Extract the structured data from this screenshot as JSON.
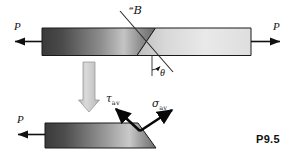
{
  "figure": {
    "tag": "P9.5",
    "labels": {
      "force_left_top": "P",
      "force_right_top": "P",
      "force_left_bottom": "P",
      "plane": "ᵊB",
      "plane_fallback": "P",
      "theta": "θ",
      "tau_symbol": "τ",
      "tau_sub": "av",
      "sigma_symbol": "σ",
      "sigma_sub": "av"
    },
    "colors": {
      "bar_dark": "#3f3f3f",
      "bar_mid": "#d6d6d6",
      "bar_light": "#f0f0f0",
      "outline": "#1a1a1a",
      "arrow_block": "#c9c9c9",
      "text": "#101010",
      "background": "#ffffff"
    },
    "elements": {
      "top_bar": "prismatic-bar-with-inclined-section-plane",
      "bottom_bar": "lower-segment-with-inclined-face",
      "transition_arrow": "downward-block-arrow",
      "stress_vectors": "average-shear-and-normal-stress-arrows"
    }
  }
}
